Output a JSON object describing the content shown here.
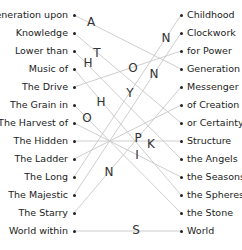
{
  "left_items": [
    "Generation upon",
    "Knowledge",
    "Lower than",
    "Music of",
    "The Drive",
    "The Grain in",
    "The Harvest of",
    "The Hidden",
    "The Ladder",
    "The Long",
    "The Majestic",
    "The Starry",
    "World within"
  ],
  "right_items": [
    "Childhood",
    "Clockwork",
    "for Power",
    "Generation",
    "Messenger",
    "of Creation",
    "or Certainty",
    "Structure",
    "the Angels",
    "the Seasons",
    "the Spheres",
    "the Stone",
    "World"
  ],
  "connections": [
    [
      0,
      3
    ],
    [
      1,
      6
    ],
    [
      2,
      8
    ],
    [
      3,
      10
    ],
    [
      4,
      2
    ],
    [
      5,
      11
    ],
    [
      6,
      9
    ],
    [
      7,
      7
    ],
    [
      8,
      5
    ],
    [
      9,
      0
    ],
    [
      10,
      1
    ],
    [
      11,
      4
    ],
    [
      12,
      12
    ]
  ],
  "letters": [
    {
      "ch": "A",
      "x": 91,
      "y": 22
    },
    {
      "ch": "N",
      "x": 166,
      "y": 38
    },
    {
      "ch": "T",
      "x": 97,
      "y": 53
    },
    {
      "ch": "H",
      "x": 88,
      "y": 63
    },
    {
      "ch": "O",
      "x": 133,
      "y": 68
    },
    {
      "ch": "N",
      "x": 154,
      "y": 74
    },
    {
      "ch": "Y",
      "x": 130,
      "y": 93
    },
    {
      "ch": "H",
      "x": 101,
      "y": 102
    },
    {
      "ch": "O",
      "x": 87,
      "y": 118
    },
    {
      "ch": "P",
      "x": 138,
      "y": 138
    },
    {
      "ch": "K",
      "x": 151,
      "y": 144
    },
    {
      "ch": "I",
      "x": 137,
      "y": 155
    },
    {
      "ch": "N",
      "x": 109,
      "y": 172
    },
    {
      "ch": "S",
      "x": 136,
      "y": 230
    }
  ],
  "colors": {
    "line": "#c8c8c8",
    "text": "#222222"
  }
}
